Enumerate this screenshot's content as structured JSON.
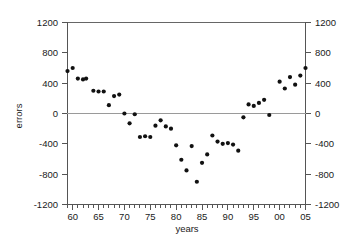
{
  "chart_data": {
    "type": "scatter",
    "title": "",
    "xlabel": "years",
    "ylabel": "errors",
    "xlim": [
      59,
      105
    ],
    "ylim": [
      -1200,
      1200
    ],
    "grid": false,
    "legend": null,
    "x_tick_labels": [
      "60",
      "65",
      "70",
      "75",
      "80",
      "85",
      "90",
      "95",
      "00",
      "05"
    ],
    "x_tick_values": [
      60,
      65,
      70,
      75,
      80,
      85,
      90,
      95,
      100,
      105
    ],
    "x_minor_tick_step": 1,
    "y_tick_labels": [
      "1200",
      "800",
      "400",
      "0",
      "-400",
      "-800",
      "-1200"
    ],
    "y_tick_values": [
      1200,
      800,
      400,
      0,
      -400,
      -800,
      -1200
    ],
    "y_axis_right_mirrored": true,
    "marker": "filled-circle",
    "marker_color": "#111111",
    "zero_line_color": "#9a9a9a",
    "axis_color": "#555555",
    "series": [
      {
        "name": "errors",
        "points": [
          [
            59,
            560
          ],
          [
            60,
            600
          ],
          [
            61,
            460
          ],
          [
            62,
            450
          ],
          [
            62.6,
            460
          ],
          [
            64,
            300
          ],
          [
            65,
            290
          ],
          [
            66,
            290
          ],
          [
            67,
            110
          ],
          [
            68,
            230
          ],
          [
            69,
            250
          ],
          [
            70,
            0
          ],
          [
            71,
            -130
          ],
          [
            72,
            -10
          ],
          [
            73,
            -310
          ],
          [
            74,
            -300
          ],
          [
            75,
            -310
          ],
          [
            76,
            -160
          ],
          [
            77,
            -90
          ],
          [
            78,
            -170
          ],
          [
            79,
            -200
          ],
          [
            80,
            -420
          ],
          [
            81,
            -610
          ],
          [
            82,
            -750
          ],
          [
            83,
            -430
          ],
          [
            84,
            -900
          ],
          [
            85,
            -650
          ],
          [
            86,
            -540
          ],
          [
            87,
            -290
          ],
          [
            88,
            -370
          ],
          [
            89,
            -400
          ],
          [
            90,
            -390
          ],
          [
            91,
            -410
          ],
          [
            92,
            -490
          ],
          [
            93,
            -50
          ],
          [
            94,
            120
          ],
          [
            95,
            100
          ],
          [
            96,
            140
          ],
          [
            97,
            180
          ],
          [
            98,
            -20
          ],
          [
            100,
            420
          ],
          [
            101,
            330
          ],
          [
            102,
            480
          ],
          [
            103,
            380
          ],
          [
            104,
            500
          ],
          [
            105,
            600
          ]
        ]
      }
    ]
  },
  "figure": {
    "background_color": "#ffffff",
    "axis_title_x": "years",
    "axis_title_y": "errors"
  }
}
